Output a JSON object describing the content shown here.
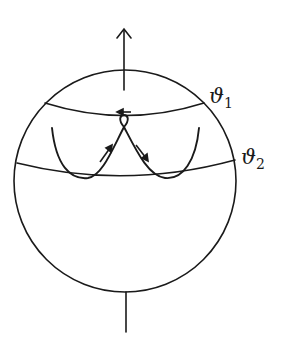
{
  "diagram": {
    "labels": {
      "theta1": {
        "symbol": "ϑ",
        "subscript": "1"
      },
      "theta2": {
        "symbol": "ϑ",
        "subscript": "2"
      }
    },
    "colors": {
      "stroke": "#1a1a1a",
      "background": "#ffffff"
    }
  }
}
